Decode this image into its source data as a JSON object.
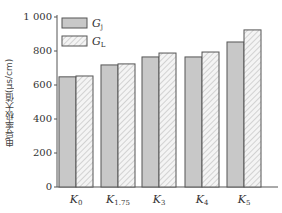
{
  "chart_data": {
    "type": "bar",
    "title": "",
    "xlabel": "",
    "ylabel": "电导率极大值(μs/cm)",
    "categories": [
      "K0",
      "K1.75",
      "K3",
      "K4",
      "K5"
    ],
    "category_labels": [
      {
        "main": "K",
        "sub": "0"
      },
      {
        "main": "K",
        "sub": "1.75"
      },
      {
        "main": "K",
        "sub": "3"
      },
      {
        "main": "K",
        "sub": "4"
      },
      {
        "main": "K",
        "sub": "5"
      }
    ],
    "series": [
      {
        "name": "Gj",
        "label_main": "G",
        "label_sub": "j",
        "fill": "solid",
        "color": "#c8c8c8",
        "values": [
          648,
          718,
          765,
          765,
          853
        ]
      },
      {
        "name": "GL",
        "label_main": "G",
        "label_sub": "L",
        "fill": "hatched",
        "color": "#f2f2f2",
        "values": [
          653,
          724,
          788,
          794,
          924
        ]
      }
    ],
    "ylim": [
      0,
      1000
    ],
    "yticks": [
      0,
      200,
      400,
      600,
      800,
      1000
    ],
    "ytick_labels": [
      "0",
      "200",
      "400",
      "600",
      "800",
      "1 000"
    ],
    "grid": false,
    "legend_position": "upper-left"
  }
}
